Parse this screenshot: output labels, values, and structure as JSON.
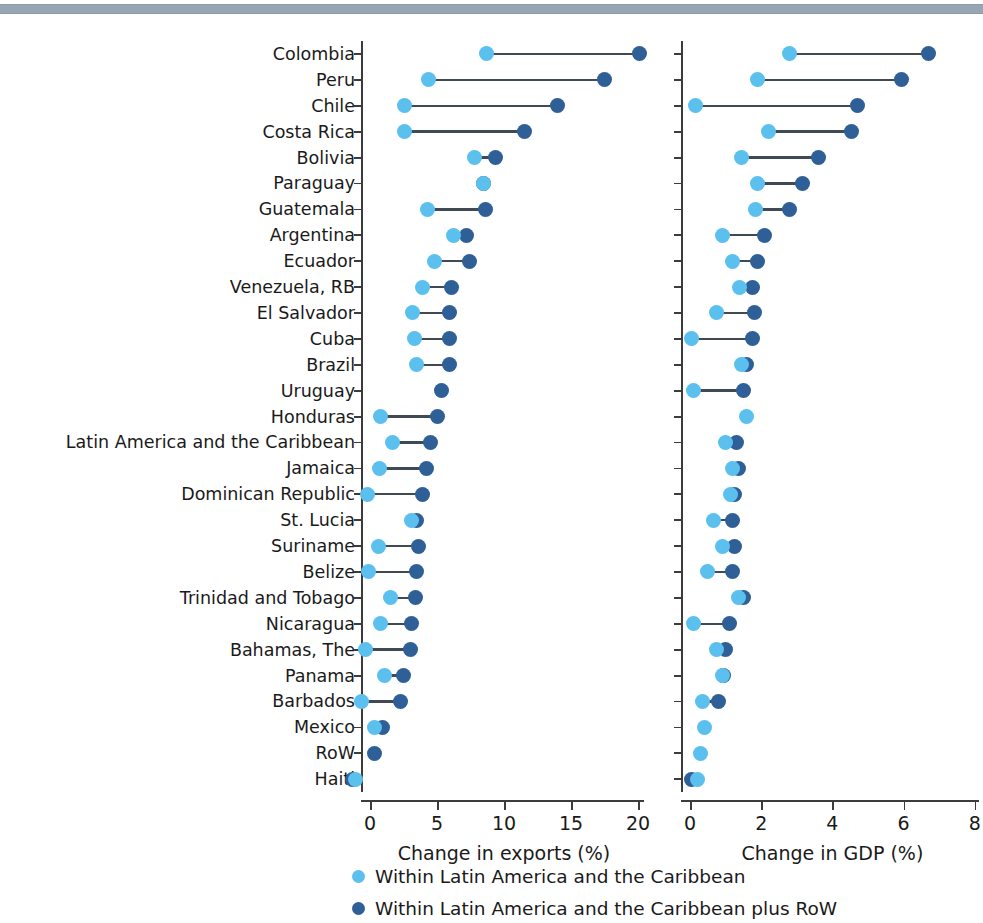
{
  "figure": {
    "type": "dumbbell",
    "categories_axis": "country",
    "colors": {
      "light": "#5bc0ee",
      "dark": "#2e5f96",
      "connector": "#404a55",
      "axis": "#3c3c3c",
      "topbar": "#98a5b3"
    }
  },
  "legend": {
    "position": "bottom",
    "items": [
      {
        "label": "Within Latin America and the Caribbean",
        "color": "#5bc0ee",
        "key": "light"
      },
      {
        "label": "Within Latin America and the Caribbean plus RoW",
        "color": "#2e5f96",
        "key": "dark"
      }
    ]
  },
  "categories": [
    "Colombia",
    "Peru",
    "Chile",
    "Costa Rica",
    "Bolivia",
    "Paraguay",
    "Guatemala",
    "Argentina",
    "Ecuador",
    "Venezuela, RB",
    "El Salvador",
    "Cuba",
    "Brazil",
    "Uruguay",
    "Honduras",
    "Latin America and the Caribbean",
    "Jamaica",
    "Dominican Republic",
    "St. Lucia",
    "Suriname",
    "Belize",
    "Trinidad and Tobago",
    "Nicaragua",
    "Bahamas, The",
    "Panama",
    "Barbados",
    "Mexico",
    "RoW",
    "Haiti"
  ],
  "chart_data": [
    {
      "type": "scatter",
      "id": "exports",
      "title": "",
      "xlabel": "Change in exports (%)",
      "ylabel": "",
      "xlim": [
        -1.6,
        20.8
      ],
      "xticks": [
        0,
        5,
        10,
        15,
        20
      ],
      "xticklabels": [
        "0",
        "5",
        "10",
        "15",
        "20"
      ],
      "grid": false,
      "categories": [
        "Colombia",
        "Peru",
        "Chile",
        "Costa Rica",
        "Bolivia",
        "Paraguay",
        "Guatemala",
        "Argentina",
        "Ecuador",
        "Venezuela, RB",
        "El Salvador",
        "Cuba",
        "Brazil",
        "Uruguay",
        "Honduras",
        "Latin America and the Caribbean",
        "Jamaica",
        "Dominican Republic",
        "St. Lucia",
        "Suriname",
        "Belize",
        "Trinidad and Tobago",
        "Nicaragua",
        "Bahamas, The",
        "Panama",
        "Barbados",
        "Mexico",
        "RoW",
        "Haiti"
      ],
      "series": [
        {
          "name": "Within Latin America and the Caribbean",
          "color": "#5bc0ee",
          "values": [
            8.7,
            4.4,
            2.6,
            2.6,
            7.8,
            8.5,
            4.3,
            6.2,
            4.8,
            3.9,
            3.2,
            3.3,
            3.5,
            null,
            0.8,
            1.7,
            0.7,
            -0.2,
            3.1,
            0.6,
            -0.1,
            1.5,
            0.8,
            -0.3,
            1.1,
            -0.6,
            0.3,
            null,
            -1.1
          ]
        },
        {
          "name": "Within Latin America and the Caribbean plus RoW",
          "color": "#2e5f96",
          "values": [
            20.1,
            17.5,
            14.0,
            11.5,
            9.4,
            8.5,
            8.6,
            7.2,
            7.4,
            6.1,
            5.9,
            5.9,
            5.9,
            5.3,
            5.0,
            4.5,
            4.2,
            3.9,
            3.5,
            3.6,
            3.5,
            3.4,
            3.1,
            3.0,
            2.5,
            2.3,
            0.9,
            0.3,
            -1.3
          ]
        }
      ]
    },
    {
      "type": "scatter",
      "id": "gdp",
      "title": "",
      "xlabel": "Change in GDP (%)",
      "ylabel": "",
      "xlim": [
        -0.55,
        8.2
      ],
      "xticks": [
        0,
        2,
        4,
        6,
        8
      ],
      "xticklabels": [
        "0",
        "2",
        "4",
        "6",
        "8"
      ],
      "grid": false,
      "categories": [
        "Colombia",
        "Peru",
        "Chile",
        "Costa Rica",
        "Bolivia",
        "Paraguay",
        "Guatemala",
        "Argentina",
        "Ecuador",
        "Venezuela, RB",
        "El Salvador",
        "Cuba",
        "Brazil",
        "Uruguay",
        "Honduras",
        "Latin America and the Caribbean",
        "Jamaica",
        "Dominican Republic",
        "St. Lucia",
        "Suriname",
        "Belize",
        "Trinidad and Tobago",
        "Nicaragua",
        "Bahamas, The",
        "Panama",
        "Barbados",
        "Mexico",
        "RoW",
        "Haiti"
      ],
      "series": [
        {
          "name": "Within Latin America and the Caribbean",
          "color": "#5bc0ee",
          "values": [
            2.8,
            1.9,
            0.15,
            2.2,
            1.45,
            1.9,
            1.85,
            0.9,
            1.2,
            1.4,
            0.75,
            0.05,
            1.45,
            0.1,
            1.6,
            1.0,
            1.2,
            1.15,
            0.65,
            0.9,
            0.5,
            1.35,
            0.1,
            0.75,
            0.9,
            0.35,
            0.4,
            0.3,
            0.2
          ]
        },
        {
          "name": "Within Latin America and the Caribbean plus RoW",
          "color": "#2e5f96",
          "values": [
            6.7,
            5.95,
            4.7,
            4.55,
            3.6,
            3.15,
            2.8,
            2.1,
            1.9,
            1.75,
            1.8,
            1.75,
            1.6,
            1.5,
            null,
            1.3,
            1.35,
            1.25,
            1.2,
            1.25,
            1.2,
            1.5,
            1.1,
            1.0,
            0.95,
            0.8,
            null,
            null,
            0.05
          ]
        }
      ]
    }
  ]
}
